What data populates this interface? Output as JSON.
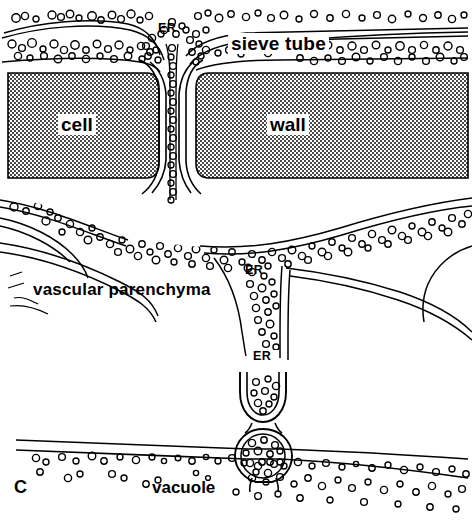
{
  "figure": {
    "panel_letter": "C",
    "width": 472,
    "height": 521,
    "background_color": "#ffffff",
    "ink_color": "#000000",
    "wall_fill_color": "#808080",
    "labels": {
      "er_top": "ER",
      "sieve_tube": "sieve tube",
      "cell": "cell",
      "wall": "wall",
      "vascular_parenchyma": "vascular  parenchyma",
      "er_middle": "ER",
      "er_bottom": "ER",
      "vacuole": "vacuole"
    }
  }
}
